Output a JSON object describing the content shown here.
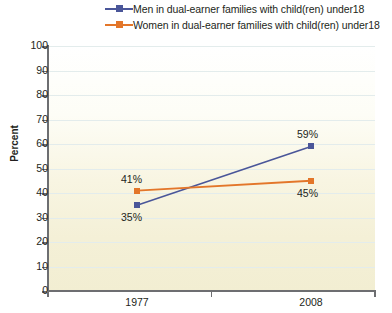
{
  "chart_data": {
    "type": "line",
    "title": "",
    "xlabel": "",
    "ylabel": "Percent",
    "categories": [
      "1977",
      "2008"
    ],
    "ylim": [
      0,
      100
    ],
    "yticks": [
      0,
      10,
      20,
      30,
      40,
      50,
      60,
      70,
      80,
      90,
      100
    ],
    "ytick_labels": [
      "0",
      "10",
      "20",
      "30",
      "40",
      "50",
      "60",
      "70",
      "80",
      "90",
      "100"
    ],
    "grid": true,
    "legend_position": "top",
    "series": [
      {
        "name": "Men in dual-earner families with child(ren) under18",
        "color": "#4a5699",
        "marker": "square",
        "values": [
          35,
          59
        ],
        "point_labels": [
          "35%",
          "59%"
        ]
      },
      {
        "name": "Women in dual-earner families with child(ren) under18",
        "color": "#e3762a",
        "marker": "square",
        "values": [
          41,
          45
        ],
        "point_labels": [
          "41%",
          "45%"
        ]
      }
    ]
  },
  "legend": {
    "items": [
      {
        "label": "Men in dual-earner families with child(ren) under18",
        "color": "#4a5699"
      },
      {
        "label": "Women in dual-earner families with child(ren) under18",
        "color": "#e3762a"
      }
    ]
  },
  "axis": {
    "y_title": "Percent",
    "y_labels": [
      "100",
      "90",
      "80",
      "70",
      "60",
      "50",
      "40",
      "30",
      "20",
      "10",
      "0"
    ],
    "x_labels": [
      "1977",
      "2008"
    ]
  },
  "annotations": {
    "men_1977": "35%",
    "men_2008": "59%",
    "women_1977": "41%",
    "women_2008": "45%"
  },
  "colors": {
    "men": "#4a5699",
    "women": "#e3762a",
    "axis": "#6d6e71",
    "grid": "#e3ecec",
    "text": "#231f20"
  }
}
